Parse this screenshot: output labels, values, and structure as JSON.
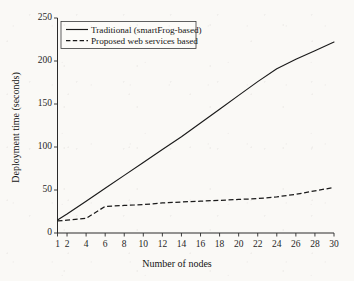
{
  "chart_data": {
    "type": "line",
    "title": "",
    "subtitle": "",
    "xlabel": "Number of nodes",
    "ylabel": "Deployment time (seconds)",
    "xlim": [
      1,
      30
    ],
    "ylim": [
      0,
      250
    ],
    "grid": false,
    "legend_position": "upper left (inside axes)",
    "x_ticks": [
      1,
      2,
      4,
      6,
      8,
      10,
      12,
      14,
      16,
      18,
      20,
      22,
      24,
      26,
      28,
      30
    ],
    "x_tick_labels": [
      "1",
      "2",
      "4",
      "6",
      "8",
      "10",
      "12",
      "14",
      "16",
      "18",
      "20",
      "22",
      "24",
      "26",
      "28",
      "30"
    ],
    "y_ticks": [
      0,
      50,
      100,
      150,
      200,
      250
    ],
    "y_tick_labels": [
      "0",
      "50",
      "100",
      "150",
      "200",
      "250"
    ],
    "x": [
      1,
      2,
      4,
      6,
      8,
      10,
      12,
      14,
      16,
      18,
      20,
      22,
      24,
      26,
      28,
      30
    ],
    "series": [
      {
        "name": "Traditional (smartFrog-based)",
        "style": "solid",
        "color": "#1a1a1a",
        "values": [
          15,
          22,
          37,
          52,
          67,
          82,
          97,
          112,
          128,
          144,
          160,
          176,
          191,
          202,
          212,
          222
        ]
      },
      {
        "name": "Proposed web services based",
        "style": "dashed",
        "color": "#1a1a1a",
        "values": [
          14,
          15,
          17,
          31,
          32,
          33,
          35,
          36,
          37,
          38,
          39,
          40,
          42,
          45,
          49,
          53
        ]
      }
    ]
  },
  "legend": {
    "entries": [
      {
        "label": "Traditional (smartFrog-based)",
        "style": "solid"
      },
      {
        "label": "Proposed web services based",
        "style": "dashed"
      }
    ]
  },
  "axes": {
    "x_title": "Number of nodes",
    "y_title": "Deployment time (seconds)"
  }
}
